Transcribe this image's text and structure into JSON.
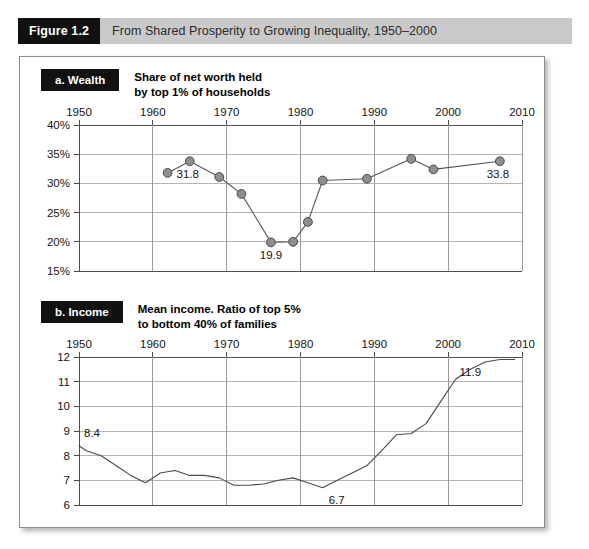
{
  "figure": {
    "number": "Figure 1.2",
    "caption": "From Shared Prosperity to Growing Inequality, 1950–2000"
  },
  "panels": [
    {
      "tag": "a. Wealth",
      "title": "Share of net worth held\nby top 1% of households"
    },
    {
      "tag": "b. Income",
      "title": "Mean income. Ratio of top 5%\nto bottom 40% of families"
    }
  ],
  "chart_data": [
    {
      "type": "line",
      "title": "Share of net worth held by top 1% of households",
      "panel_tag": "a. Wealth",
      "xlabel": "",
      "ylabel": "",
      "xlim": [
        1950,
        2010
      ],
      "ylim": [
        15,
        40
      ],
      "xticks": [
        1950,
        1960,
        1970,
        1980,
        1990,
        2000,
        2010
      ],
      "xtick_labels": [
        "1950",
        "1960",
        "1970",
        "1980",
        "1990",
        "2000",
        "2010"
      ],
      "yticks": [
        15,
        20,
        25,
        30,
        35,
        40
      ],
      "ytick_labels": [
        "15%",
        "20%",
        "25%",
        "30%",
        "35%",
        "40%"
      ],
      "grid": true,
      "legend": "none",
      "markers": true,
      "marker_color": "#8e8e8e",
      "line_color": "#555555",
      "x": [
        1962,
        1965,
        1969,
        1972,
        1976,
        1979,
        1981,
        1983,
        1989,
        1995,
        1998,
        2007
      ],
      "values": [
        31.8,
        33.8,
        31.1,
        28.2,
        19.9,
        20.0,
        23.4,
        30.5,
        30.8,
        34.2,
        32.4,
        33.8
      ],
      "annotations": [
        {
          "text": "31.8",
          "x": 1962,
          "y": 31.8,
          "position": "right"
        },
        {
          "text": "19.9",
          "x": 1976,
          "y": 19.9,
          "position": "below"
        },
        {
          "text": "33.8",
          "x": 2007,
          "y": 33.8,
          "position": "below-left"
        }
      ]
    },
    {
      "type": "line",
      "title": "Mean income. Ratio of top 5% to bottom 40% of families",
      "panel_tag": "b. Income",
      "xlabel": "",
      "ylabel": "",
      "xlim": [
        1950,
        2010
      ],
      "ylim": [
        6,
        12
      ],
      "xticks": [
        1950,
        1960,
        1970,
        1980,
        1990,
        2000,
        2010
      ],
      "xtick_labels": [
        "1950",
        "1960",
        "1970",
        "1980",
        "1990",
        "2000",
        "2010"
      ],
      "yticks": [
        6,
        7,
        8,
        9,
        10,
        11,
        12
      ],
      "ytick_labels": [
        "6",
        "7",
        "8",
        "9",
        "10",
        "11",
        "12"
      ],
      "grid": true,
      "legend": "none",
      "markers": false,
      "line_color": "#4a4a4a",
      "x": [
        1950,
        1951,
        1953,
        1955,
        1957,
        1959,
        1961,
        1963,
        1965,
        1967,
        1969,
        1971,
        1973,
        1975,
        1977,
        1979,
        1981,
        1983,
        1985,
        1987,
        1989,
        1991,
        1993,
        1995,
        1997,
        1999,
        2001,
        2003,
        2005,
        2007,
        2009
      ],
      "values": [
        8.4,
        8.2,
        8.0,
        7.6,
        7.2,
        6.9,
        7.3,
        7.4,
        7.2,
        7.2,
        7.1,
        6.8,
        6.8,
        6.85,
        7.0,
        7.1,
        6.9,
        6.7,
        7.0,
        7.3,
        7.6,
        8.2,
        8.85,
        8.9,
        9.3,
        10.2,
        11.1,
        11.5,
        11.8,
        11.9,
        11.9
      ],
      "annotations": [
        {
          "text": "8.4",
          "x": 1950,
          "y": 8.4,
          "position": "above-right"
        },
        {
          "text": "6.7",
          "x": 1983,
          "y": 6.7,
          "position": "below-right"
        },
        {
          "text": "11.9",
          "x": 2003,
          "y": 11.9,
          "position": "below"
        }
      ]
    }
  ]
}
